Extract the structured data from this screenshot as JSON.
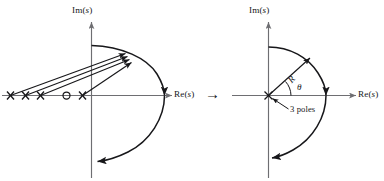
{
  "figure": {
    "caption_faint": "",
    "transition_arrow": "→"
  },
  "left_plot": {
    "name": "root-locus-original-s-plane",
    "im_axis_label": "Im(s)",
    "re_axis_label": "Re(s)",
    "poles_label": "",
    "markers": [
      {
        "type": "pole",
        "symbol": "×",
        "x": -5.2,
        "y": 0
      },
      {
        "type": "pole",
        "symbol": "×",
        "x": -4.1,
        "y": 0
      },
      {
        "type": "pole",
        "symbol": "×",
        "x": -3.1,
        "y": 0
      },
      {
        "type": "zero",
        "symbol": "○",
        "x": -1.5,
        "y": 0
      },
      {
        "type": "pole",
        "symbol": "×",
        "x": -0.9,
        "y": 0
      }
    ],
    "ray_count": 4,
    "arc_description": "large circular arc of radius R centered near origin"
  },
  "right_plot": {
    "name": "root-locus-reduced-s-plane",
    "im_axis_label": "Im(s)",
    "re_axis_label": "Re(s)",
    "radius_label": "R",
    "angle_label": "θ",
    "pole_annotation": "3 poles",
    "origin_marker": {
      "type": "pole",
      "symbol": "×",
      "x": 0,
      "y": 0
    },
    "arc_description": "quarter/semicircular arc of radius R centered at origin"
  },
  "colors": {
    "axis": "#6e6e72",
    "curve": "#17171a",
    "text": "#17171a",
    "background": "#ffffff"
  }
}
